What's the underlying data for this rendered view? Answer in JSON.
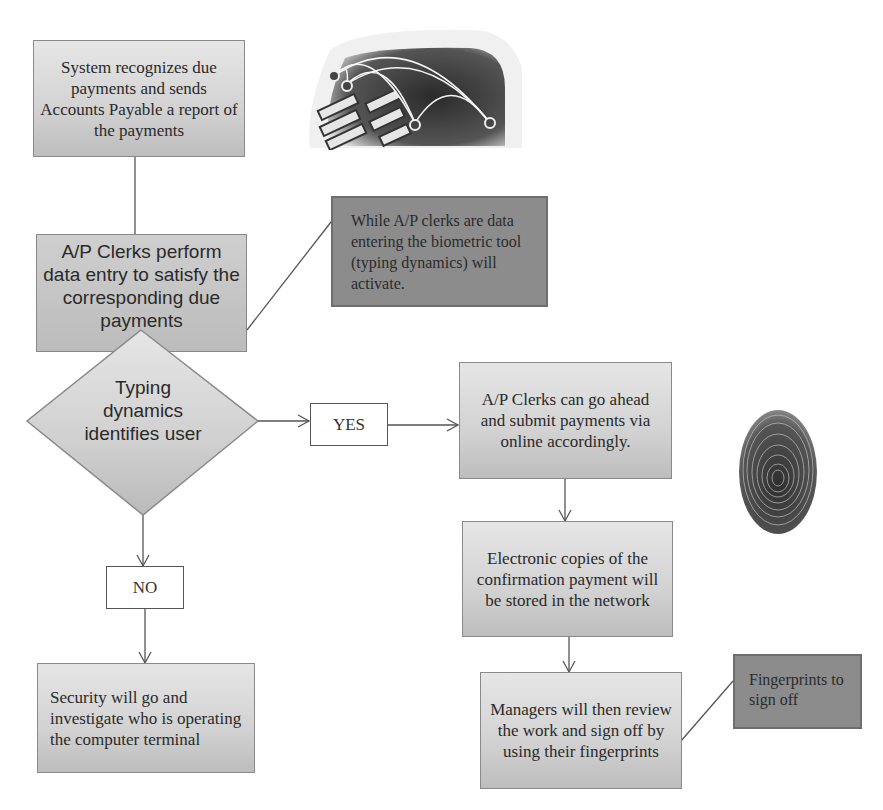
{
  "flowchart": {
    "nodes": {
      "system_report": {
        "label": "System recognizes due payments and sends Accounts Payable a report of the payments"
      },
      "data_entry": {
        "label": "A/P Clerks perform data entry to satisfy the corresponding due payments"
      },
      "biometric_note": {
        "label": "While A/P clerks are data entering the biometric tool (typing dynamics) will activate."
      },
      "decision": {
        "label": "Typing dynamics identifies user"
      },
      "yes": {
        "label": "YES"
      },
      "no": {
        "label": "NO"
      },
      "submit_payments": {
        "label": "A/P Clerks can go ahead and submit payments via online accordingly."
      },
      "store_copies": {
        "label": "Electronic copies of the confirmation payment will be stored in the network"
      },
      "manager_signoff": {
        "label": "Managers will then review the work and sign off by using their fingerprints"
      },
      "fingerprint_note": {
        "label": "Fingerprints to sign off"
      },
      "security": {
        "label": "Security will go and investigate who is operating the computer terminal"
      }
    },
    "images": {
      "keyboard": {
        "icon": "keyboard-network-icon"
      },
      "fingerprint": {
        "icon": "fingerprint-icon"
      }
    },
    "colors": {
      "box_fill": "#d2d2d2",
      "note_fill": "#8c8c8c",
      "line": "#555555",
      "background": "#ffffff"
    }
  }
}
